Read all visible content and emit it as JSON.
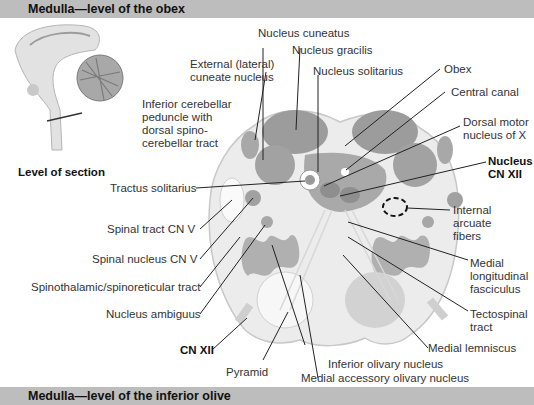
{
  "header": {
    "title": "Medulla—level of the obex"
  },
  "footer": {
    "title": "Medulla—level of the inferior olive"
  },
  "inset": {
    "caption": "Level of section"
  },
  "labels": {
    "nucleus_cuneatus": "Nucleus cuneatus",
    "nucleus_gracilis": "Nucleus gracilis",
    "external_cuneate_1": "External (lateral)",
    "external_cuneate_2": "cuneate nucleus",
    "nucleus_solitarius": "Nucleus solitarius",
    "obex": "Obex",
    "central_canal": "Central canal",
    "dorsal_motor_1": "Dorsal motor",
    "dorsal_motor_2": "nucleus of X",
    "icp_1": "Inferior cerebellar",
    "icp_2": "peduncle with",
    "icp_3": "dorsal spino-",
    "icp_4": "cerebellar tract",
    "nucleus_cn12_1": "Nucleus",
    "nucleus_cn12_2": "CN XII",
    "tractus_solitarius": "Tractus solitarius",
    "internal_arcuate_1": "Internal",
    "internal_arcuate_2": "arcuate",
    "internal_arcuate_3": "fibers",
    "spinal_tract_cn5": "Spinal tract CN V",
    "spinal_nucleus_cn5": "Spinal nucleus CN V",
    "mlf_1": "Medial",
    "mlf_2": "longitudinal",
    "mlf_3": "fasciculus",
    "spinothalamic": "Spinothalamic/spinoreticular tract",
    "nucleus_ambiguus": "Nucleus ambiguus",
    "tectospinal_1": "Tectospinal",
    "tectospinal_2": "tract",
    "cn12": "CN XII",
    "medial_lemniscus": "Medial lemniscus",
    "pyramid": "Pyramid",
    "inferior_olivary": "Inferior olivary nucleus",
    "medial_accessory_olivary": "Medial accessory olivary nucleus"
  },
  "colors": {
    "bar": "#bdbdbd",
    "tissue": "#eeeeee",
    "nucleus": "#9a9a9a",
    "tract": "#ffffff",
    "leader": "#222222"
  }
}
